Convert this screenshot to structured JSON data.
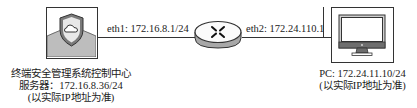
{
  "diagram": {
    "server": {
      "icon": "shield-cloud-icon",
      "caption_lines": [
        "终端安全管理系统控制中心",
        "服务器：172.16.8.36/24",
        "(以实际IP地址为准)"
      ]
    },
    "router": {
      "icon": "router-icon",
      "eth1_label": "eth1: 172.16.8.1/24",
      "eth2_label": "eth2: 172.24.110.1"
    },
    "pc": {
      "icon": "monitor-icon",
      "caption_lines": [
        "PC: 172.24.11.10/24",
        "(以实际IP地址为准)"
      ]
    },
    "colors": {
      "line": "#333333",
      "gray_fill": "#bdbdbd",
      "dark_gray": "#6e6e6e"
    }
  }
}
